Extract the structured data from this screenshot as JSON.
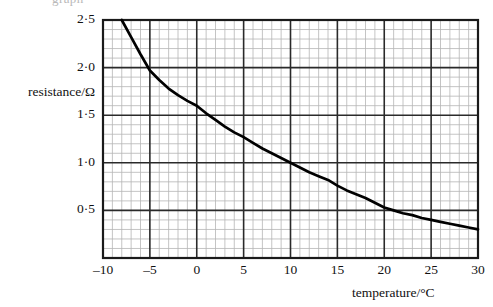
{
  "figure": {
    "cut_caption_fragment": "graph",
    "axes": {
      "y_axis_label": "resistance/Ω",
      "x_axis_label": "temperature/°C"
    }
  },
  "chart_data": {
    "type": "line",
    "title": "",
    "subtitle": "",
    "xlabel": "temperature/°C",
    "ylabel": "resistance/Ω",
    "xlim": [
      -10,
      30
    ],
    "ylim": [
      0,
      2.5
    ],
    "grid": true,
    "legend": "none",
    "x_tick_labels": [
      "-10",
      "-5",
      "0",
      "5",
      "10",
      "15",
      "20",
      "25",
      "30"
    ],
    "x_tick_values": [
      -10,
      -5,
      0,
      5,
      10,
      15,
      20,
      25,
      30
    ],
    "y_tick_labels": [
      "2·5",
      "2·0",
      "1·5",
      "1·0",
      "0·5"
    ],
    "y_tick_values": [
      2.5,
      2.0,
      1.5,
      1.0,
      0.5
    ],
    "x_major_step": 5,
    "x_minor_step": 1,
    "y_major_step": 0.5,
    "y_minor_step": 0.1,
    "series": [
      {
        "name": "resistance vs temperature",
        "color": "#000000",
        "x": [
          -8,
          -7,
          -6,
          -5,
          -4,
          -3,
          -2,
          -1,
          0,
          1,
          2,
          3,
          4,
          5,
          6,
          7,
          8,
          9,
          10,
          11,
          12,
          13,
          14,
          15,
          16,
          17,
          18,
          19,
          20,
          21,
          22,
          23,
          24,
          25,
          26,
          27,
          28,
          29,
          30
        ],
        "values": [
          2.5,
          2.32,
          2.14,
          1.97,
          1.87,
          1.78,
          1.71,
          1.65,
          1.6,
          1.52,
          1.45,
          1.38,
          1.32,
          1.27,
          1.21,
          1.15,
          1.1,
          1.05,
          1.0,
          0.95,
          0.9,
          0.86,
          0.82,
          0.76,
          0.71,
          0.67,
          0.63,
          0.58,
          0.53,
          0.5,
          0.47,
          0.45,
          0.42,
          0.4,
          0.38,
          0.36,
          0.34,
          0.32,
          0.3
        ]
      }
    ],
    "notable_points": [
      {
        "x": -8,
        "y": 2.5
      },
      {
        "x": -5,
        "y": 1.97
      },
      {
        "x": 0,
        "y": 1.6
      },
      {
        "x": 5,
        "y": 1.27
      },
      {
        "x": 10,
        "y": 1.0
      },
      {
        "x": 15,
        "y": 0.76
      },
      {
        "x": 20,
        "y": 0.53
      },
      {
        "x": 25,
        "y": 0.4
      },
      {
        "x": 30,
        "y": 0.3
      }
    ]
  },
  "colors": {
    "curve": "#000000",
    "major_grid": "#2a2a2a",
    "minor_grid": "#b5b5b5",
    "axis_frame": "#1a1a1a",
    "background": "#ffffff",
    "text": "#111111"
  }
}
